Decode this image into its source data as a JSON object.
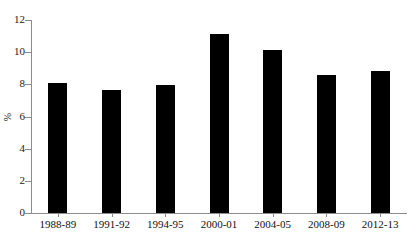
{
  "chart_data": {
    "type": "bar",
    "title": "",
    "title_note": "title cropped off top edge of screenshot",
    "xlabel": "",
    "ylabel": "%",
    "categories": [
      "1988-89",
      "1991-92",
      "1994-95",
      "2000-01",
      "2004-05",
      "2008-09",
      "2012-13"
    ],
    "values": [
      8.1,
      7.65,
      7.95,
      11.1,
      10.15,
      8.6,
      8.85
    ],
    "ylim": [
      0,
      12
    ],
    "yticks": [
      0,
      2,
      4,
      6,
      8,
      10,
      12
    ],
    "ytick_labels": [
      "0",
      "2",
      "4",
      "6",
      "8",
      "10",
      "12"
    ],
    "grid": false,
    "legend": false,
    "bar_color": "#000000",
    "axis_color": "#8c8c8c"
  },
  "axes": {
    "y_label": "%",
    "y_ticks": [
      {
        "value": 12,
        "label": "12"
      },
      {
        "value": 10,
        "label": "10"
      },
      {
        "value": 8,
        "label": "8"
      },
      {
        "value": 6,
        "label": "6"
      },
      {
        "value": 4,
        "label": "4"
      },
      {
        "value": 2,
        "label": "2"
      },
      {
        "value": 0,
        "label": "0"
      }
    ]
  },
  "title_remnant": {
    "text": ""
  }
}
